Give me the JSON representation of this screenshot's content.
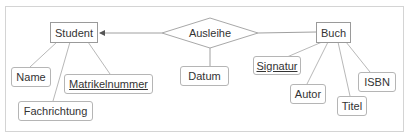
{
  "diagram": {
    "type": "er-diagram",
    "entities": [
      {
        "id": "student",
        "label": "Student"
      },
      {
        "id": "buch",
        "label": "Buch"
      }
    ],
    "relationships": [
      {
        "id": "ausleihe",
        "label": "Ausleihe",
        "connects": [
          "student",
          "buch"
        ],
        "arrow_to": "student"
      }
    ],
    "attributes": {
      "name": {
        "label": "Name",
        "of": "student",
        "key": false
      },
      "matrikelnummer": {
        "label": "Matrikelnummer",
        "of": "student",
        "key": true
      },
      "fachrichtung": {
        "label": "Fachrichtung",
        "of": "student",
        "key": false
      },
      "datum": {
        "label": "Datum",
        "of": "ausleihe",
        "key": false
      },
      "signatur": {
        "label": "Signatur",
        "of": "buch",
        "key": true
      },
      "autor": {
        "label": "Autor",
        "of": "buch",
        "key": false
      },
      "titel": {
        "label": "Titel",
        "of": "buch",
        "key": false
      },
      "isbn": {
        "label": "ISBN",
        "of": "buch",
        "key": false
      }
    },
    "colors": {
      "line": "#b0b0b0",
      "border": "#9a9a9a",
      "text": "#333333",
      "frame": "#d4d4d4"
    }
  }
}
